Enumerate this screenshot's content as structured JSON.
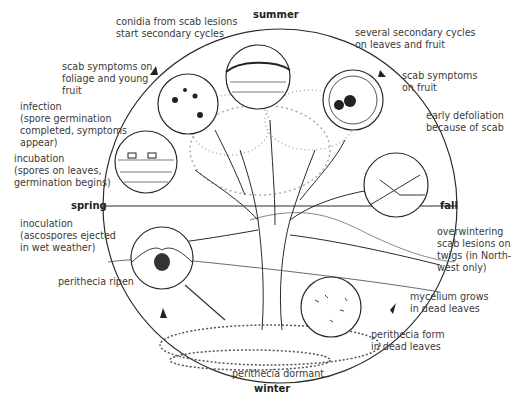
{
  "seasons": {
    "summer": "summer",
    "fall": "fall",
    "winter": "winter",
    "spring": "spring"
  },
  "labels": {
    "conidia": "conidia from scab lesions\nstart secondary cycles",
    "secondary_cycles": "several secondary cycles\non leaves and fruit",
    "scab_foliage": "scab symptoms on\nfoliage and young\nfruit",
    "scab_fruit": "scab symptoms\non fruit",
    "infection": "infection\n(spore germination\ncompleted, symptoms\nappear)",
    "defoliation": "early defoliation\nbecause of scab",
    "incubation": "incubation\n(spores on leaves,\ngermination begins)",
    "overwintering": "overwintering\nscab lesions on\ntwigs (in North-\nwest only)",
    "inoculation": "inoculation\n(ascospores ejected\nin wet weather)",
    "perithecia_ripen": "perithecia ripen",
    "mycelium": "mycelium grows\nin dead leaves",
    "perithecia_form": "perithecia form\nin dead leaves",
    "perithecia_dormant": "perithecia dormant"
  },
  "colors": {
    "ink": "#2a2a2a",
    "text": "#3a3a3a",
    "background": "#ffffff"
  }
}
